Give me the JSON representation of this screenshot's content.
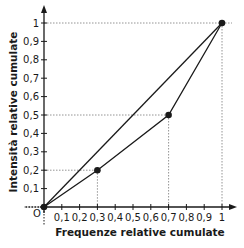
{
  "chart_data": {
    "type": "line",
    "title": "",
    "xlabel": "Frequenze  relative cumulate",
    "ylabel": "Intensità  relative cumulate",
    "origin_label": "O",
    "xlim": [
      0,
      1
    ],
    "ylim": [
      0,
      1
    ],
    "x_ticks": [
      "0,1",
      "0,2",
      "0,3",
      "0,4",
      "0,5",
      "0,6",
      "0,7",
      "0,8",
      "0,9",
      "1"
    ],
    "y_ticks": [
      "0,1",
      "0,2",
      "0,3",
      "0,4",
      "0,5",
      "0,6",
      "0,7",
      "0,8",
      "0,9",
      "1"
    ],
    "grid": false,
    "series": [
      {
        "name": "Equidistribution line",
        "x": [
          0,
          1
        ],
        "y": [
          0,
          1
        ],
        "markers": false
      },
      {
        "name": "Concentration curve",
        "x": [
          0,
          0.3,
          0.7,
          1
        ],
        "y": [
          0,
          0.2,
          0.5,
          1
        ],
        "markers": true
      }
    ],
    "guide_lines": [
      {
        "point": [
          0.3,
          0.2
        ]
      },
      {
        "point": [
          0.7,
          0.5
        ]
      },
      {
        "point": [
          1,
          1
        ]
      }
    ],
    "colors": {
      "line": "#1a1a1a",
      "guide": "#888888"
    }
  }
}
